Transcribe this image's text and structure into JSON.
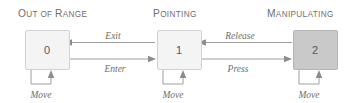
{
  "diagram": {
    "type": "state-machine",
    "title": "",
    "background_color": "#ffffff",
    "states": [
      {
        "id": "out-of-range",
        "header": "Out of Range",
        "header_first_letters": [
          "O",
          "R"
        ],
        "label": "0",
        "fill": "#f4f4f4",
        "stroke": "#d2d2d2",
        "self_loop_label": "Move"
      },
      {
        "id": "pointing",
        "header": "Pointing",
        "label": "1",
        "fill": "#f4f4f4",
        "stroke": "#d2d2d2",
        "self_loop_label": "Move"
      },
      {
        "id": "manipulating",
        "header": "Manipulating",
        "label": "2",
        "fill": "#c9c9c9",
        "stroke": "#b4b4b4",
        "self_loop_label": "Move"
      }
    ],
    "transitions": [
      {
        "id": "exit",
        "from": "pointing",
        "to": "out-of-range",
        "label": "Exit",
        "direction": "left"
      },
      {
        "id": "enter",
        "from": "out-of-range",
        "to": "pointing",
        "label": "Enter",
        "direction": "right"
      },
      {
        "id": "release",
        "from": "manipulating",
        "to": "pointing",
        "label": "Release",
        "direction": "left"
      },
      {
        "id": "press",
        "from": "pointing",
        "to": "manipulating",
        "label": "Press",
        "direction": "right"
      }
    ],
    "headers": {
      "out_of_range": "Out of Range",
      "pointing": "Pointing",
      "manipulating": "Manipulating"
    },
    "header_parts": {
      "out_of_range": {
        "c1": "O",
        "w1": "UT",
        "c2": " ",
        "w2": "OF ",
        "c3": "R",
        "w3": "ANGE"
      },
      "pointing": {
        "c1": "P",
        "w1": "OINTING"
      },
      "manipulating": {
        "c1": "M",
        "w1": "ANIPULATING"
      }
    },
    "loop_labels": {
      "state0": "Move",
      "state1": "Move",
      "state2": "Move"
    },
    "edge_labels": {
      "exit": "Exit",
      "enter": "Enter",
      "release": "Release",
      "press": "Press"
    },
    "state_numbers": {
      "state0": "0",
      "state1": "1",
      "state2": "2"
    },
    "colors": {
      "line": "#9e9e9e",
      "arrow": "#8d8d8d",
      "text": "#6d6d6d",
      "header_text": "#6e6e6e",
      "box_light_fill": "#f4f4f4",
      "box_light_stroke": "#d2d2d2",
      "box_dark_fill": "#c9c9c9",
      "box_dark_stroke": "#b4b4b4"
    }
  }
}
